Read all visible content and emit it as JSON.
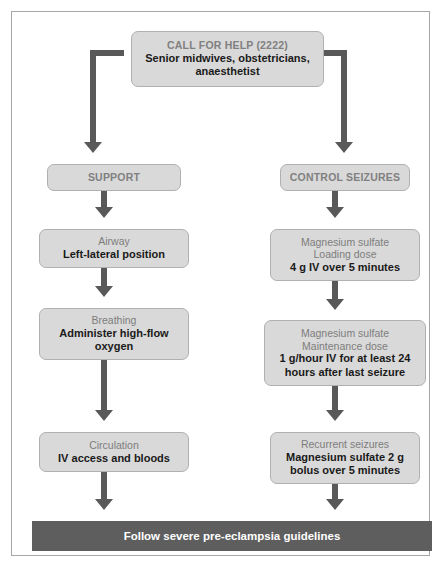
{
  "colors": {
    "node_fill": "#d9d9d9",
    "node_border": "#b0b0b0",
    "connector": "#595959",
    "heading_text": "#808080",
    "body_text": "#1a1a1a",
    "footer_fill": "#5e5e5e",
    "footer_text": "#ffffff",
    "frame_border": "#a6a6a6"
  },
  "header": {
    "heading": "CALL FOR HELP (2222)",
    "line1": "Senior midwives, obstetricians,",
    "line2": "anaesthetist"
  },
  "left_branch": {
    "title": "SUPPORT",
    "steps": [
      {
        "heading": "Airway",
        "line1": "Left-lateral position",
        "line2": ""
      },
      {
        "heading": "Breathing",
        "line1": "Administer high-flow",
        "line2": "oxygen"
      },
      {
        "heading": "Circulation",
        "line1": "IV access and bloods",
        "line2": ""
      }
    ]
  },
  "right_branch": {
    "title": "CONTROL SEIZURES",
    "steps": [
      {
        "heading": "Magnesium sulfate",
        "subheading": "Loading dose",
        "line1": "4 g IV over 5 minutes",
        "line2": ""
      },
      {
        "heading": "Magnesium sulfate",
        "subheading": "Maintenance dose",
        "line1": "1 g/hour IV for at least 24",
        "line2": "hours after last seizure"
      },
      {
        "heading": "Recurrent seizures",
        "subheading": "",
        "line1": "Magnesium sulfate 2 g",
        "line2": "bolus over 5 minutes"
      }
    ]
  },
  "footer": {
    "label": "Follow severe pre-eclampsia guidelines"
  }
}
